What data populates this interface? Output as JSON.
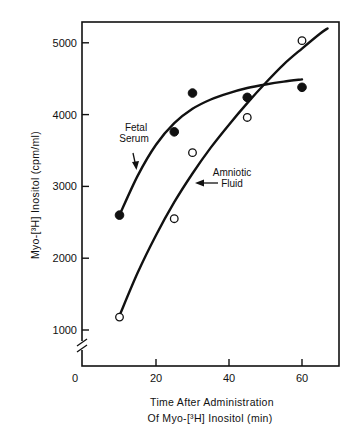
{
  "chart_data": {
    "type": "scatter",
    "title": "",
    "xlabel_lines": [
      "Time After Administration",
      "Of Myo-[³H] Inositol (min)"
    ],
    "ylabel": "Myo-[³H] Inositol (cpm/ml)",
    "xlim": [
      0,
      70
    ],
    "ylim": [
      1000,
      5300
    ],
    "x_ticks": [
      20,
      40,
      60
    ],
    "x_tick_labels": [
      "20",
      "40",
      "60"
    ],
    "x_origin_label": "0",
    "y_ticks": [
      1000,
      2000,
      3000,
      4000,
      5000
    ],
    "y_tick_labels": [
      "1000",
      "2000",
      "3000",
      "4000",
      "5000"
    ],
    "y_axis_break": true,
    "grid": false,
    "series": [
      {
        "name": "Fetal Serum",
        "marker": "filled-circle",
        "points": [
          [
            10,
            2600
          ],
          [
            25,
            3760
          ],
          [
            30,
            4300
          ],
          [
            45,
            4240
          ],
          [
            60,
            4380
          ]
        ],
        "fit_curve": [
          [
            10,
            2600
          ],
          [
            15,
            3150
          ],
          [
            20,
            3580
          ],
          [
            25,
            3880
          ],
          [
            30,
            4080
          ],
          [
            35,
            4210
          ],
          [
            40,
            4300
          ],
          [
            45,
            4370
          ],
          [
            50,
            4420
          ],
          [
            55,
            4460
          ],
          [
            60,
            4490
          ]
        ]
      },
      {
        "name": "Amniotic Fluid",
        "marker": "open-circle",
        "points": [
          [
            10,
            1180
          ],
          [
            25,
            2550
          ],
          [
            30,
            3470
          ],
          [
            45,
            3960
          ],
          [
            60,
            5030
          ]
        ],
        "fit_curve": [
          [
            10,
            1200
          ],
          [
            15,
            1800
          ],
          [
            20,
            2320
          ],
          [
            25,
            2780
          ],
          [
            30,
            3180
          ],
          [
            35,
            3540
          ],
          [
            40,
            3860
          ],
          [
            45,
            4160
          ],
          [
            50,
            4440
          ],
          [
            55,
            4700
          ],
          [
            60,
            4920
          ],
          [
            65,
            5130
          ],
          [
            67,
            5200
          ]
        ]
      }
    ],
    "annotations": [
      {
        "text_lines": [
          "Fetal",
          "Serum"
        ],
        "points_to": "Fetal Serum",
        "arrow": "down"
      },
      {
        "text_lines": [
          "Amniotic",
          "Fluid"
        ],
        "points_to": "Amniotic Fluid",
        "arrow": "left"
      }
    ]
  }
}
